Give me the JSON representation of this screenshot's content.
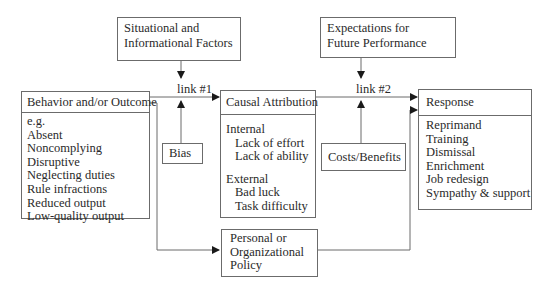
{
  "diagram": {
    "nodes": {
      "situational": {
        "lines": [
          "Situational and",
          "Informational Factors"
        ]
      },
      "expectations": {
        "lines": [
          "Expectations for",
          "Future Performance"
        ]
      },
      "behavior": {
        "title": "Behavior and/or Outcome",
        "items": [
          "e.g.",
          "Absent",
          "Noncomplying",
          "Disruptive",
          "Neglecting duties",
          "Rule infractions",
          "Reduced output",
          "Low-quality output"
        ]
      },
      "bias": {
        "label": "Bias"
      },
      "causal": {
        "title": "Causal Attribution",
        "internal": {
          "label": "Internal",
          "items": [
            "Lack of effort",
            "Lack of ability"
          ]
        },
        "external": {
          "label": "External",
          "items": [
            "Bad luck",
            "Task difficulty"
          ]
        }
      },
      "costs": {
        "label": "Costs/Benefits"
      },
      "response": {
        "title": "Response",
        "items": [
          "Reprimand",
          "Training",
          "Dismissal",
          "Enrichment",
          "Job redesign",
          "Sympathy & support"
        ]
      },
      "policy": {
        "lines": [
          "Personal or",
          "Organizational",
          "Policy"
        ]
      }
    },
    "links": {
      "link1": "link #1",
      "link2": "link #2"
    },
    "edges": [
      {
        "from": "behavior",
        "to": "causal",
        "label": "link #1"
      },
      {
        "from": "situational",
        "to": "link #1"
      },
      {
        "from": "bias",
        "to": "link #1"
      },
      {
        "from": "causal",
        "to": "response",
        "label": "link #2"
      },
      {
        "from": "expectations",
        "to": "link #2"
      },
      {
        "from": "costs",
        "to": "link #2"
      },
      {
        "from": "behavior",
        "to": "policy"
      },
      {
        "from": "policy",
        "to": "response"
      }
    ],
    "colors": {
      "line": "#6b6b6b",
      "text": "#2a2a2a",
      "arrow": "#1a1a1a"
    }
  }
}
